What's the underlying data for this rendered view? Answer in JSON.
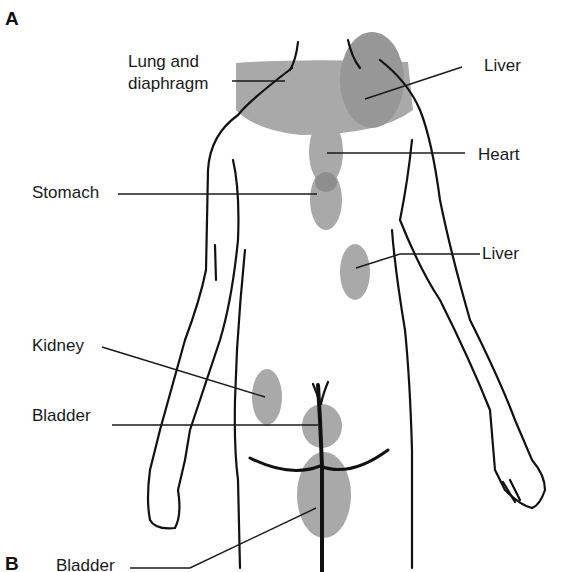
{
  "figure": {
    "panel_a": "A",
    "panel_b": "B",
    "shade_color": "#a9a9a9",
    "overlap_color": "#8e8e8e",
    "outline_color": "#111111"
  },
  "labels": {
    "lung_line1": "Lung and",
    "lung_line2": "diaphragm",
    "liver_top": "Liver",
    "heart": "Heart",
    "stomach": "Stomach",
    "liver_mid": "Liver",
    "kidney": "Kidney",
    "bladder_a": "Bladder",
    "bladder_b": "Bladder"
  }
}
